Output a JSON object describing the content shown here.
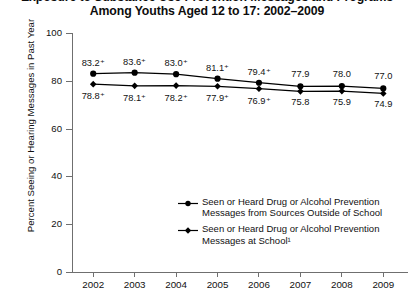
{
  "title": {
    "line1": "Exposure to Substance Use Prevention Messages and Programs",
    "line2": "Among Youths Aged 12 to 17: 2002–2009"
  },
  "axes": {
    "ylabel": "Percent Seeing or Hearing Messages in Past Year",
    "xlabel": ""
  },
  "legend": {
    "entry1_line1": "Seen or Heard Drug or Alcohol Prevention",
    "entry1_line2": "Messages from Sources Outside of School",
    "entry2_line1": "Seen or Heard Drug or Alcohol Prevention",
    "entry2_line2": "Messages at School¹"
  },
  "chart_data": {
    "type": "line",
    "title": "Exposure to Substance Use Prevention Messages and Programs Among Youths Aged 12 to 17: 2002–2009",
    "xlabel": "",
    "ylabel": "Percent Seeing or Hearing Messages in Past Year",
    "categories": [
      "2002",
      "2003",
      "2004",
      "2005",
      "2006",
      "2007",
      "2008",
      "2009"
    ],
    "ylim": [
      0,
      100
    ],
    "yticks": [
      "0",
      "20",
      "40",
      "60",
      "80",
      "100"
    ],
    "grid": false,
    "legend_position": "inside-lower-right",
    "series": [
      {
        "name": "Seen or Heard Drug or Alcohol Prevention Messages from Sources Outside of School",
        "values": [
          83.2,
          83.6,
          83.0,
          81.1,
          79.4,
          77.9,
          78.0,
          77.0
        ],
        "labels": [
          "83.2⁺",
          "83.6⁺",
          "83.0⁺",
          "81.1⁺",
          "79.4⁺",
          "77.9",
          "78.0",
          "77.0"
        ],
        "color": "#000000",
        "marker": "circle"
      },
      {
        "name": "Seen or Heard Drug or Alcohol Prevention Messages at School¹",
        "values": [
          78.8,
          78.1,
          78.2,
          77.9,
          76.9,
          75.8,
          75.9,
          74.9
        ],
        "labels": [
          "78.8⁺",
          "78.1⁺",
          "78.2⁺",
          "77.9⁺",
          "76.9⁺",
          "75.8",
          "75.9",
          "74.9"
        ],
        "color": "#000000",
        "marker": "diamond"
      }
    ]
  }
}
